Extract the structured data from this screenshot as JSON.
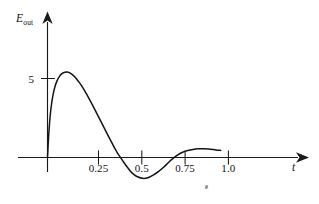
{
  "figure": {
    "background_color": "#ffffff",
    "ink_color": "#141414",
    "width": 319,
    "height": 204
  },
  "axes": {
    "y_axis_label": "E",
    "y_axis_label_subscript": "out",
    "x_axis_label": "t",
    "y_ticks": [
      {
        "label": "5",
        "value": 5
      }
    ],
    "x_ticks": [
      {
        "label": "0.25",
        "value": 0.25
      },
      {
        "label": "0.5",
        "value": 0.5
      },
      {
        "label": "0.75",
        "value": 0.75
      },
      {
        "label": "1.0",
        "value": 1.0
      }
    ]
  },
  "chart_data": {
    "type": "line",
    "title": "",
    "subtitle": "",
    "xlabel": "t",
    "ylabel": "E_out",
    "xlim": [
      -0.17,
      1.45
    ],
    "ylim": [
      -2.5,
      8.2
    ],
    "grid": false,
    "legend": null,
    "annotations": [],
    "axis_style": {
      "spine": "arrowed-cross",
      "x_tick_labels": [
        "0.25",
        "0.5",
        "0.75",
        "1.0"
      ],
      "y_tick_labels": [
        "5"
      ],
      "ticks_cross_axis": true
    },
    "series": [
      {
        "name": "E_out",
        "color": "#141414",
        "x": [
          0.0,
          0.005,
          0.012,
          0.02,
          0.03,
          0.042,
          0.055,
          0.07,
          0.085,
          0.1,
          0.12,
          0.14,
          0.16,
          0.18,
          0.2,
          0.225,
          0.25,
          0.275,
          0.3,
          0.325,
          0.35,
          0.375,
          0.4,
          0.42,
          0.44,
          0.46,
          0.48,
          0.5,
          0.52,
          0.55,
          0.58,
          0.61,
          0.64,
          0.67,
          0.7,
          0.72,
          0.75,
          0.78,
          0.81,
          0.84,
          0.87,
          0.9,
          0.93,
          0.96,
          0.985,
          1.0
        ],
        "y": [
          0.0,
          1.05,
          2.2,
          3.1,
          3.85,
          4.45,
          4.85,
          5.15,
          5.32,
          5.4,
          5.4,
          5.28,
          5.08,
          4.8,
          4.48,
          4.02,
          3.52,
          3.0,
          2.46,
          1.92,
          1.38,
          0.86,
          0.36,
          0.02,
          -0.3,
          -0.6,
          -0.88,
          -1.08,
          -1.22,
          -1.32,
          -1.28,
          -1.12,
          -0.9,
          -0.62,
          -0.3,
          -0.1,
          0.15,
          0.33,
          0.44,
          0.51,
          0.55,
          0.56,
          0.54,
          0.5,
          0.46,
          0.45
        ]
      }
    ],
    "features": {
      "peak_value": 5.4,
      "peak_at_t": 0.115,
      "first_zero_crossing_t": 0.425,
      "trough_value": -1.32,
      "trough_at_t": 0.55,
      "second_zero_crossing_t": 0.735,
      "second_hump_value": 0.56,
      "second_hump_at_t": 0.9,
      "curve_end_t": 1.0
    }
  }
}
